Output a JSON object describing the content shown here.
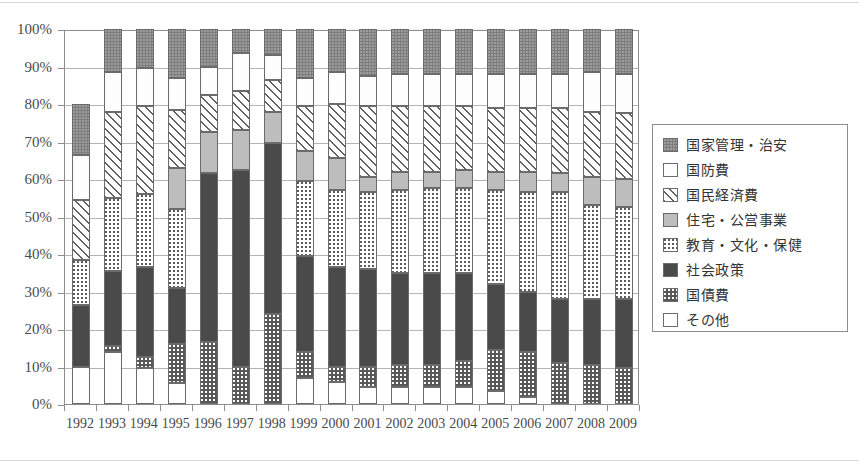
{
  "chart_data": {
    "type": "bar",
    "stacked": true,
    "stacked_mode": "percent",
    "title": "",
    "subtitle": "",
    "xlabel": "",
    "ylabel": "",
    "ylim": [
      0,
      100
    ],
    "ytick_labels": [
      "0%",
      "10%",
      "20%",
      "30%",
      "40%",
      "50%",
      "60%",
      "70%",
      "80%",
      "90%",
      "100%"
    ],
    "ytick_values": [
      0,
      10,
      20,
      30,
      40,
      50,
      60,
      70,
      80,
      90,
      100
    ],
    "grid": true,
    "legend_position": "right",
    "categories": [
      "1992",
      "1993",
      "1994",
      "1995",
      "1996",
      "1997",
      "1998",
      "1999",
      "2000",
      "2001",
      "2002",
      "2003",
      "2004",
      "2005",
      "2006",
      "2007",
      "2008",
      "2009"
    ],
    "stack_order_bottom_to_top": [
      "その他",
      "国債費",
      "社会政策",
      "教育・文化・保健",
      "住宅・公営事業",
      "国民経済費",
      "国防費",
      "国家管理・治安"
    ],
    "series": [
      {
        "name": "その他",
        "pattern": "white",
        "values": [
          10.0,
          14.0,
          9.5,
          5.5,
          0.0,
          0.0,
          0.0,
          7.0,
          6.0,
          4.5,
          4.5,
          4.5,
          4.5,
          3.5,
          2.0,
          0.0,
          0.0,
          0.0
        ]
      },
      {
        "name": "国債費",
        "pattern": "dark-dotted",
        "values": [
          0.0,
          1.5,
          3.0,
          10.5,
          16.5,
          10.0,
          24.0,
          7.0,
          4.0,
          5.5,
          6.0,
          6.0,
          7.0,
          11.0,
          12.0,
          11.0,
          10.5,
          9.5
        ]
      },
      {
        "name": "社会政策",
        "pattern": "solid-dark",
        "values": [
          16.5,
          20.0,
          24.0,
          15.0,
          45.0,
          52.5,
          45.5,
          25.5,
          26.5,
          26.0,
          24.5,
          24.5,
          23.5,
          17.5,
          16.0,
          17.0,
          17.5,
          18.5
        ]
      },
      {
        "name": "教育・文化・保健",
        "pattern": "white-dotted",
        "values": [
          12.0,
          19.5,
          19.5,
          21.0,
          0.0,
          0.0,
          0.0,
          20.0,
          20.5,
          20.5,
          22.0,
          22.5,
          22.5,
          25.0,
          26.5,
          28.5,
          25.0,
          24.5
        ]
      },
      {
        "name": "住宅・公営事業",
        "pattern": "light-gray",
        "values": [
          0.0,
          0.0,
          0.0,
          11.0,
          11.0,
          10.5,
          8.5,
          8.0,
          8.5,
          4.0,
          5.0,
          4.5,
          5.0,
          5.0,
          5.5,
          5.0,
          7.5,
          7.5
        ]
      },
      {
        "name": "国民経済費",
        "pattern": "diagonal-hatch",
        "values": [
          16.0,
          23.0,
          23.5,
          15.5,
          10.0,
          10.5,
          8.5,
          12.0,
          14.5,
          19.0,
          17.5,
          17.5,
          17.0,
          17.0,
          17.0,
          17.5,
          17.5,
          17.5
        ]
      },
      {
        "name": "国防費",
        "pattern": "white",
        "values": [
          12.0,
          10.5,
          10.0,
          8.5,
          7.5,
          10.0,
          6.5,
          7.5,
          8.5,
          8.0,
          8.5,
          8.5,
          8.5,
          9.0,
          9.0,
          9.0,
          10.5,
          10.5
        ]
      },
      {
        "name": "国家管理・治安",
        "pattern": "gray-speckle",
        "values": [
          13.5,
          11.5,
          10.5,
          13.0,
          10.0,
          6.5,
          7.0,
          13.0,
          11.5,
          12.5,
          12.0,
          12.0,
          12.0,
          12.0,
          12.0,
          12.0,
          11.5,
          12.0
        ]
      }
    ]
  },
  "legend": {
    "items": [
      {
        "label": "国家管理・治安",
        "pattern": "gray-speckle"
      },
      {
        "label": "国防費",
        "pattern": "white"
      },
      {
        "label": "国民経済費",
        "pattern": "diagonal-hatch"
      },
      {
        "label": "住宅・公営事業",
        "pattern": "light-gray"
      },
      {
        "label": "教育・文化・保健",
        "pattern": "white-dotted"
      },
      {
        "label": "社会政策",
        "pattern": "solid-dark"
      },
      {
        "label": "国債費",
        "pattern": "dark-dotted"
      },
      {
        "label": "その他",
        "pattern": "white"
      }
    ]
  },
  "colors": {
    "axis": "#8d8d8d",
    "gridline": "#b4b4b4",
    "text": "#4a4a4a",
    "state_admin": "#7d7d7d",
    "defense": "#ffffff",
    "economy": "#ffffff",
    "housing": "#bdbdbd",
    "education": "#ffffff",
    "social": "#4a4a4a",
    "debt": "#585858",
    "other": "#ffffff"
  }
}
